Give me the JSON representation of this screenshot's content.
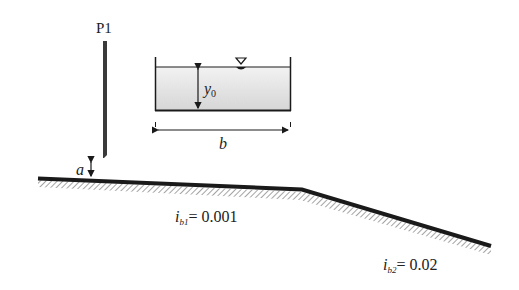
{
  "gate": {
    "label": "P1",
    "opening_label": "a"
  },
  "cross_section": {
    "depth_label": "y",
    "depth_sub": "0",
    "width_label": "b",
    "water_surface_symbol": "▽"
  },
  "slopes": [
    {
      "label": "i",
      "sub": "b1",
      "value": "= 0.001"
    },
    {
      "label": "i",
      "sub": "b2",
      "value": "= 0.02"
    }
  ],
  "colors": {
    "line": "#1a1a1a",
    "water": "#dcdcdc",
    "hatch": "#9a9a9a"
  }
}
